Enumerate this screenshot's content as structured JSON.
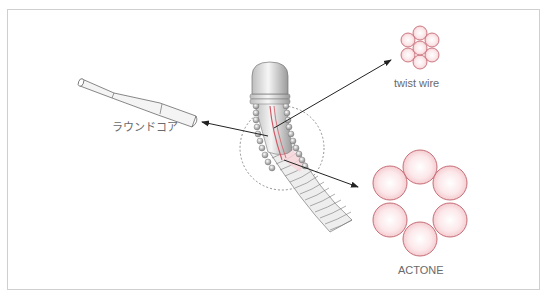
{
  "diagram": {
    "labels": {
      "round_core": "ラウンドコア",
      "twist_wire": "twist wire",
      "actone": "ACTONE"
    },
    "colors": {
      "frame_border": "#cfcfcf",
      "strand_fill": "#fbe3e6",
      "strand_stroke": "#c0606a",
      "arrow": "#222222",
      "text": "#6a6a6a",
      "metal": "#d9d9d9"
    }
  }
}
